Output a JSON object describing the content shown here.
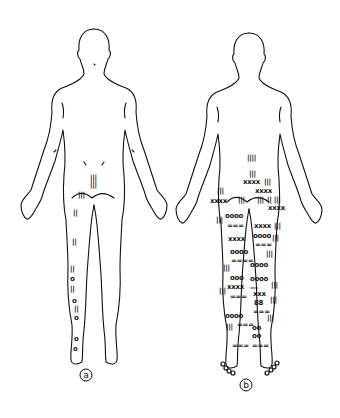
{
  "figure": {
    "panels": [
      {
        "id": "a",
        "label": "a",
        "view": "posterior body outline",
        "markings": [
          {
            "sym": "|||",
            "x": 90,
            "y": 180
          },
          {
            "sym": "|||",
            "x": 90,
            "y": 187
          },
          {
            "sym": "|||",
            "x": 78,
            "y": 197
          },
          {
            "sym": "||",
            "x": 73,
            "y": 215
          },
          {
            "sym": "||",
            "x": 72,
            "y": 244
          },
          {
            "sym": "||",
            "x": 70,
            "y": 271
          },
          {
            "sym": "o",
            "x": 70,
            "y": 281
          },
          {
            "sym": "||",
            "x": 70,
            "y": 291
          },
          {
            "sym": "o",
            "x": 72,
            "y": 303
          },
          {
            "sym": "||",
            "x": 74,
            "y": 311
          },
          {
            "sym": "o",
            "x": 74,
            "y": 320
          },
          {
            "sym": "o",
            "x": 74,
            "y": 341
          },
          {
            "sym": "o",
            "x": 73,
            "y": 351
          }
        ]
      },
      {
        "id": "b",
        "label": "b",
        "view": "posterior body outline",
        "markings": [
          {
            "sym": "||||",
            "x": 247,
            "y": 160
          },
          {
            "sym": "|||",
            "x": 249,
            "y": 176
          },
          {
            "sym": "xxxx",
            "x": 243,
            "y": 184
          },
          {
            "sym": "|||",
            "x": 264,
            "y": 184
          },
          {
            "sym": "xxxx",
            "x": 255,
            "y": 193
          },
          {
            "sym": "|||",
            "x": 217,
            "y": 193
          },
          {
            "sym": "xxxx",
            "x": 210,
            "y": 203
          },
          {
            "sym": "|||",
            "x": 238,
            "y": 202
          },
          {
            "sym": "|||",
            "x": 257,
            "y": 202
          },
          {
            "sym": "|| |||",
            "x": 267,
            "y": 202
          },
          {
            "sym": "xxxx",
            "x": 268,
            "y": 210
          },
          {
            "sym": "|||",
            "x": 216,
            "y": 222
          },
          {
            "sym": "oooo",
            "x": 225,
            "y": 218
          },
          {
            "sym": "===",
            "x": 227,
            "y": 228
          },
          {
            "sym": "xxxx",
            "x": 254,
            "y": 228
          },
          {
            "sym": "|||",
            "x": 274,
            "y": 228
          },
          {
            "sym": "xxxx",
            "x": 228,
            "y": 241
          },
          {
            "sym": "oooo",
            "x": 253,
            "y": 238
          },
          {
            "sym": "|||",
            "x": 272,
            "y": 240
          },
          {
            "sym": "===",
            "x": 255,
            "y": 247
          },
          {
            "sym": "oooo",
            "x": 230,
            "y": 254
          },
          {
            "sym": "|||",
            "x": 266,
            "y": 256
          },
          {
            "sym": "====",
            "x": 231,
            "y": 263
          },
          {
            "sym": "oooo",
            "x": 250,
            "y": 267
          },
          {
            "sym": "|||",
            "x": 223,
            "y": 270
          },
          {
            "sym": "ooo",
            "x": 230,
            "y": 280
          },
          {
            "sym": "oooo",
            "x": 250,
            "y": 281
          },
          {
            "sym": "xxxx",
            "x": 227,
            "y": 289
          },
          {
            "sym": "---",
            "x": 250,
            "y": 290
          },
          {
            "sym": "|||",
            "x": 271,
            "y": 287
          },
          {
            "sym": "|||",
            "x": 219,
            "y": 293
          },
          {
            "sym": "===",
            "x": 230,
            "y": 299
          },
          {
            "sym": "xxx",
            "x": 253,
            "y": 296
          },
          {
            "sym": "88",
            "x": 254,
            "y": 305
          },
          {
            "sym": "|||",
            "x": 270,
            "y": 302
          },
          {
            "sym": "===",
            "x": 253,
            "y": 314
          },
          {
            "sym": "oooo",
            "x": 225,
            "y": 318
          },
          {
            "sym": "|||",
            "x": 267,
            "y": 320
          },
          {
            "sym": "|||",
            "x": 226,
            "y": 329
          },
          {
            "sym": "===",
            "x": 237,
            "y": 327
          },
          {
            "sym": "oo",
            "x": 252,
            "y": 330
          },
          {
            "sym": "oo",
            "x": 252,
            "y": 338
          },
          {
            "sym": "===",
            "x": 232,
            "y": 348
          },
          {
            "sym": "===",
            "x": 252,
            "y": 348
          }
        ],
        "toe_circles": [
          {
            "x": 223,
            "y": 364
          },
          {
            "x": 226,
            "y": 368
          },
          {
            "x": 229,
            "y": 371
          },
          {
            "x": 233,
            "y": 373
          },
          {
            "x": 267,
            "y": 373
          },
          {
            "x": 271,
            "y": 370
          },
          {
            "x": 274,
            "y": 367
          },
          {
            "x": 277,
            "y": 363
          }
        ]
      }
    ]
  }
}
